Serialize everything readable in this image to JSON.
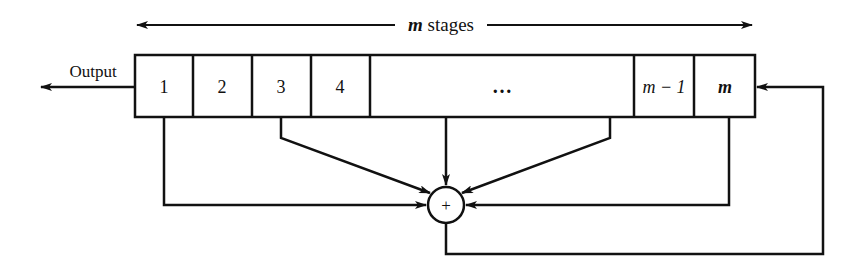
{
  "diagram": {
    "stages_label": {
      "var": "m",
      "text": " stages"
    },
    "output_label": "Output",
    "cells": [
      {
        "label": "1",
        "italic": false
      },
      {
        "label": "2",
        "italic": false
      },
      {
        "label": "3",
        "italic": false
      },
      {
        "label": "4",
        "italic": false
      },
      {
        "label": "…",
        "italic": false
      },
      {
        "label": "m − 1",
        "italic": true
      },
      {
        "label": "m",
        "italic": true
      }
    ],
    "adder_symbol": "+",
    "taps": [
      "1",
      "3",
      "…",
      "m − 2",
      "m"
    ],
    "colors": {
      "line": "#111111",
      "background": "#ffffff"
    }
  }
}
